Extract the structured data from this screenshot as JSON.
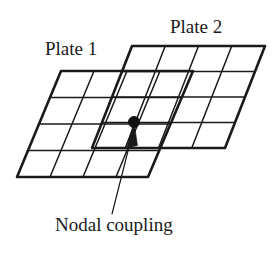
{
  "figure": {
    "background_color": "#ffffff",
    "line_color": "#1a1a1a",
    "text_color": "#1a1a1a",
    "width": 274,
    "height": 257
  },
  "labels": {
    "plate1": "Plate 1",
    "plate2": "Plate 2",
    "nodal_coupling": "Nodal coupling"
  },
  "diagram": {
    "type": "line-drawing",
    "plates": [
      {
        "name": "Plate 1",
        "label": "Plate 1",
        "shape": "parallelogram",
        "grid_rows": 4,
        "grid_cols": 4,
        "corners": [
          [
            61,
            71
          ],
          [
            193,
            71
          ],
          [
            148,
            177
          ],
          [
            17,
            177
          ]
        ],
        "outline_width": 2.6,
        "grid_width": 1.5,
        "z_order": 1
      },
      {
        "name": "Plate 2",
        "label": "Plate 2",
        "shape": "parallelogram",
        "grid_rows": 4,
        "grid_cols": 4,
        "corners": [
          [
            132,
            46
          ],
          [
            265,
            46
          ],
          [
            225,
            148
          ],
          [
            92,
            148
          ]
        ],
        "outline_width": 2.6,
        "grid_width": 1.5,
        "z_order": 2
      }
    ],
    "node": {
      "name": "coupling-node",
      "label": "Nodal coupling",
      "position": [
        134,
        122
      ],
      "radius": 5.5,
      "fill": "#111111"
    },
    "leader": {
      "name": "nodal-coupling-leader",
      "from": [
        134,
        122
      ],
      "to": [
        112,
        214
      ],
      "arrow_tip": [
        134,
        122
      ],
      "arrow_base_left": [
        126,
        147
      ],
      "arrow_base_right": [
        137,
        145
      ],
      "stroke_width": 1.2
    }
  }
}
